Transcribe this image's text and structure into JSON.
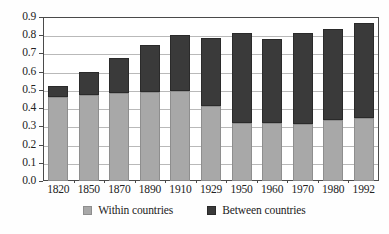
{
  "chart_data": {
    "type": "bar",
    "stacked": true,
    "title": "",
    "subtitle": "",
    "xlabel": "",
    "ylabel": "",
    "categories": [
      "1820",
      "1850",
      "1870",
      "1890",
      "1910",
      "1929",
      "1950",
      "1960",
      "1970",
      "1980",
      "1992"
    ],
    "series": [
      {
        "name": "Within countries",
        "color": "#a8a8a8",
        "values": [
          0.46,
          0.47,
          0.485,
          0.49,
          0.495,
          0.41,
          0.32,
          0.32,
          0.315,
          0.335,
          0.345
        ]
      },
      {
        "name": "Between countries",
        "color": "#3a3a3a",
        "values": [
          0.06,
          0.13,
          0.19,
          0.255,
          0.305,
          0.375,
          0.49,
          0.46,
          0.495,
          0.5,
          0.52
        ]
      }
    ],
    "totals": [
      0.52,
      0.6,
      0.675,
      0.745,
      0.8,
      0.785,
      0.81,
      0.78,
      0.81,
      0.835,
      0.865
    ],
    "ylim": [
      0.0,
      0.9
    ],
    "ytick_values": [
      "0.0",
      "0.1",
      "0.2",
      "0.3",
      "0.4",
      "0.5",
      "0.6",
      "0.7",
      "0.8",
      "0.9"
    ],
    "ytick_numbers": [
      0.0,
      0.1,
      0.2,
      0.3,
      0.4,
      0.5,
      0.6,
      0.7,
      0.8,
      0.9
    ],
    "grid": true,
    "grid_axis": "y",
    "legend_position": "bottom",
    "legend": [
      "Within countries",
      "Between countries"
    ]
  },
  "legend": {
    "within_label": "Within countries",
    "between_label": "Between countries"
  },
  "colors": {
    "within": "#a8a8a8",
    "between": "#3a3a3a",
    "grid": "#b9b9b9",
    "axis": "#4a4a4a",
    "background": "#ffffff"
  }
}
